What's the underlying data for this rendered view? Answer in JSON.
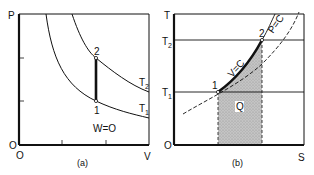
{
  "panels": [
    {
      "id": "a",
      "caption": "(a)",
      "y_axis_label": "P",
      "x_axis_label": "V",
      "origin_y_label": "O",
      "origin_x_label": "O",
      "curves": [
        {
          "name": "isotherm-T2",
          "label_main": "T",
          "label_sub": "2"
        },
        {
          "name": "isotherm-T1",
          "label_main": "T",
          "label_sub": "1"
        }
      ],
      "points": [
        {
          "label": "2"
        },
        {
          "label": "1"
        }
      ],
      "annotation": "W=O"
    },
    {
      "id": "b",
      "caption": "(b)",
      "y_axis_label": "T",
      "x_axis_label": "S",
      "origin_y_label": "O",
      "y_ticks": [
        {
          "main": "T",
          "sub": "2"
        },
        {
          "main": "T",
          "sub": "1"
        }
      ],
      "curves": [
        {
          "name": "constant-volume",
          "label": "V=C"
        },
        {
          "name": "constant-pressure",
          "label": "P=C"
        }
      ],
      "points": [
        {
          "label": "1"
        },
        {
          "label": "2"
        }
      ],
      "shaded_label": "Q"
    }
  ],
  "colors": {
    "line": "#111111",
    "shade": "#b8b8b8"
  }
}
